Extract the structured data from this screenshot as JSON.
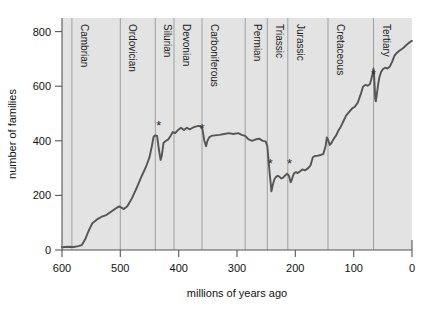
{
  "chart_data": {
    "type": "line",
    "title": "",
    "xlabel": "millions of years ago",
    "ylabel": "number of families",
    "xlim": [
      600,
      0
    ],
    "ylim": [
      0,
      850
    ],
    "x_ticks": [
      600,
      500,
      400,
      300,
      200,
      100,
      0
    ],
    "y_ticks": [
      0,
      200,
      400,
      600,
      800
    ],
    "grid": false,
    "x_axis_reversed": true,
    "legend": "none",
    "series": [
      {
        "name": "number of families",
        "points": [
          [
            600,
            10
          ],
          [
            590,
            12
          ],
          [
            580,
            11
          ],
          [
            572,
            14
          ],
          [
            566,
            18
          ],
          [
            560,
            40
          ],
          [
            554,
            72
          ],
          [
            548,
            98
          ],
          [
            540,
            112
          ],
          [
            532,
            122
          ],
          [
            524,
            128
          ],
          [
            516,
            140
          ],
          [
            508,
            152
          ],
          [
            502,
            160
          ],
          [
            498,
            155
          ],
          [
            494,
            150
          ],
          [
            488,
            160
          ],
          [
            480,
            190
          ],
          [
            472,
            228
          ],
          [
            464,
            268
          ],
          [
            456,
            305
          ],
          [
            450,
            340
          ],
          [
            446,
            380
          ],
          [
            443,
            415
          ],
          [
            440,
            420
          ],
          [
            437,
            418
          ],
          [
            434,
            370
          ],
          [
            431,
            330
          ],
          [
            429,
            345
          ],
          [
            426,
            392
          ],
          [
            422,
            400
          ],
          [
            418,
            405
          ],
          [
            414,
            418
          ],
          [
            410,
            432
          ],
          [
            406,
            428
          ],
          [
            401,
            440
          ],
          [
            396,
            448
          ],
          [
            391,
            440
          ],
          [
            386,
            448
          ],
          [
            381,
            442
          ],
          [
            376,
            448
          ],
          [
            371,
            452
          ],
          [
            366,
            455
          ],
          [
            362,
            452
          ],
          [
            359,
            440
          ],
          [
            356,
            400
          ],
          [
            353,
            380
          ],
          [
            351,
            398
          ],
          [
            348,
            412
          ],
          [
            344,
            418
          ],
          [
            338,
            420
          ],
          [
            330,
            422
          ],
          [
            322,
            425
          ],
          [
            314,
            428
          ],
          [
            306,
            425
          ],
          [
            298,
            428
          ],
          [
            292,
            422
          ],
          [
            286,
            418
          ],
          [
            280,
            405
          ],
          [
            274,
            400
          ],
          [
            268,
            405
          ],
          [
            262,
            408
          ],
          [
            256,
            400
          ],
          [
            251,
            398
          ],
          [
            248,
            380
          ],
          [
            246,
            330
          ],
          [
            244,
            280
          ],
          [
            242,
            240
          ],
          [
            241,
            215
          ],
          [
            239,
            235
          ],
          [
            236,
            258
          ],
          [
            233,
            268
          ],
          [
            230,
            272
          ],
          [
            227,
            268
          ],
          [
            224,
            262
          ],
          [
            221,
            265
          ],
          [
            218,
            272
          ],
          [
            214,
            280
          ],
          [
            211,
            272
          ],
          [
            208,
            248
          ],
          [
            206,
            258
          ],
          [
            204,
            272
          ],
          [
            202,
            282
          ],
          [
            199,
            285
          ],
          [
            196,
            282
          ],
          [
            192,
            288
          ],
          [
            188,
            295
          ],
          [
            183,
            292
          ],
          [
            178,
            300
          ],
          [
            174,
            310
          ],
          [
            170,
            340
          ],
          [
            166,
            345
          ],
          [
            162,
            345
          ],
          [
            157,
            348
          ],
          [
            152,
            352
          ],
          [
            148,
            382
          ],
          [
            146,
            412
          ],
          [
            144,
            405
          ],
          [
            141,
            385
          ],
          [
            138,
            392
          ],
          [
            134,
            408
          ],
          [
            130,
            420
          ],
          [
            126,
            438
          ],
          [
            122,
            452
          ],
          [
            118,
            470
          ],
          [
            113,
            492
          ],
          [
            108,
            505
          ],
          [
            103,
            518
          ],
          [
            98,
            525
          ],
          [
            93,
            540
          ],
          [
            88,
            570
          ],
          [
            84,
            598
          ],
          [
            80,
            605
          ],
          [
            76,
            602
          ],
          [
            72,
            608
          ],
          [
            68,
            640
          ],
          [
            66,
            665
          ],
          [
            65,
            640
          ],
          [
            64,
            600
          ],
          [
            63,
            552
          ],
          [
            62,
            545
          ],
          [
            60,
            575
          ],
          [
            58,
            608
          ],
          [
            56,
            632
          ],
          [
            53,
            652
          ],
          [
            50,
            662
          ],
          [
            46,
            668
          ],
          [
            42,
            665
          ],
          [
            38,
            672
          ],
          [
            34,
            690
          ],
          [
            30,
            712
          ],
          [
            26,
            722
          ],
          [
            22,
            730
          ],
          [
            18,
            735
          ],
          [
            14,
            742
          ],
          [
            10,
            750
          ],
          [
            6,
            758
          ],
          [
            2,
            764
          ],
          [
            0,
            766
          ]
        ]
      }
    ],
    "period_boundaries": [
      {
        "label": "Cambrian",
        "start": 570,
        "line_at": 583
      },
      {
        "label": "Ordovician",
        "start": 500,
        "line_at": 500
      },
      {
        "label": "Silurian",
        "start": 440,
        "line_at": 440
      },
      {
        "label": "Devonian",
        "start": 408,
        "line_at": 408
      },
      {
        "label": "Carboniferous",
        "start": 360,
        "line_at": 360
      },
      {
        "label": "Permian",
        "start": 286,
        "line_at": 286
      },
      {
        "label": "Triassic",
        "start": 248,
        "line_at": 248
      },
      {
        "label": "Jurassic",
        "start": 213,
        "line_at": 213
      },
      {
        "label": "Cretaceous",
        "start": 144,
        "line_at": 144
      },
      {
        "label": "Tertiary",
        "start": 66,
        "line_at": 66
      }
    ],
    "extinction_markers": [
      {
        "name": "end-ordovician",
        "x": 434,
        "y": 440,
        "glyph": "*"
      },
      {
        "name": "late-devonian",
        "x": 360,
        "y": 430,
        "glyph": "*"
      },
      {
        "name": "end-permian",
        "x": 243,
        "y": 300,
        "glyph": "*"
      },
      {
        "name": "end-triassic",
        "x": 210,
        "y": 300,
        "glyph": "*"
      },
      {
        "name": "end-cretaceous",
        "x": 66,
        "y": 628,
        "glyph": "*"
      }
    ],
    "colors": {
      "plot_background": "#e3e3e3",
      "line": "#555555",
      "axis": "#555555",
      "gridline": "#999999",
      "text": "#111111",
      "page_background": "#ffffff"
    }
  }
}
